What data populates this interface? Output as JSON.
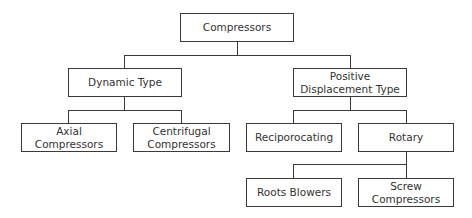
{
  "diagram": {
    "type": "tree",
    "title": "Compressors",
    "colors": {
      "line": "#3a3a3a",
      "text": "#333333",
      "background": "#ffffff"
    },
    "nodes": {
      "root": {
        "label": "Compressors"
      },
      "dynamic": {
        "label": "Dynamic Type"
      },
      "positive": {
        "label": "Positive Displacement Type"
      },
      "axial": {
        "label": "Axial Compressors"
      },
      "centrifugal": {
        "label": "Centrifugal Compressors"
      },
      "reciprocating": {
        "label": "Reciporocating"
      },
      "rotary": {
        "label": "Rotary"
      },
      "roots": {
        "label": "Roots Blowers"
      },
      "screw": {
        "label": "Screw Compressors"
      }
    },
    "edges": [
      [
        "Compressors",
        "Dynamic Type"
      ],
      [
        "Compressors",
        "Positive Displacement Type"
      ],
      [
        "Dynamic Type",
        "Axial Compressors"
      ],
      [
        "Dynamic Type",
        "Centrifugal Compressors"
      ],
      [
        "Positive Displacement Type",
        "Reciporocating"
      ],
      [
        "Positive Displacement Type",
        "Rotary"
      ],
      [
        "Rotary",
        "Roots Blowers"
      ],
      [
        "Rotary",
        "Screw Compressors"
      ]
    ]
  }
}
